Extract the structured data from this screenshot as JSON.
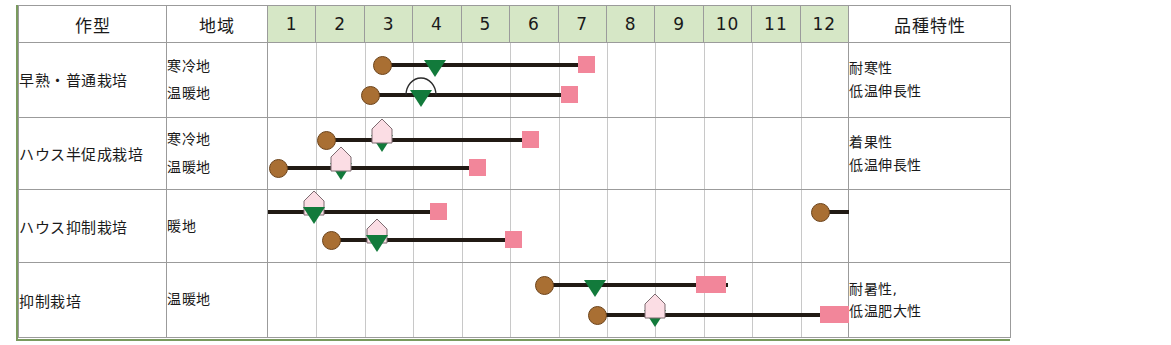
{
  "table": {
    "headers": {
      "crop_type": "作型",
      "region": "地域",
      "traits": "品種特性",
      "months": [
        "1",
        "2",
        "3",
        "4",
        "5",
        "6",
        "7",
        "8",
        "9",
        "10",
        "11",
        "12"
      ]
    },
    "rows": [
      {
        "crop_type": "早熟・普通栽培",
        "regions": [
          "寒冷地",
          "温暖地"
        ],
        "traits": [
          "耐寒性",
          "低温伸長性"
        ]
      },
      {
        "crop_type": "ハウス半促成栽培",
        "regions": [
          "寒冷地",
          "温暖地"
        ],
        "traits": [
          "着果性",
          "低温伸長性"
        ]
      },
      {
        "crop_type": "ハウス抑制栽培",
        "regions": [
          "暖地"
        ],
        "traits": []
      },
      {
        "crop_type": "抑制栽培",
        "regions": [
          "温暖地"
        ],
        "traits": [
          "耐暑性,",
          "低温肥大性"
        ]
      }
    ]
  },
  "chart_data": {
    "type": "table",
    "xlabel": "月",
    "x_axis": {
      "ticks": [
        "1",
        "2",
        "3",
        "4",
        "5",
        "6",
        "7",
        "8",
        "9",
        "10",
        "11",
        "12"
      ],
      "min": 1,
      "max": 13,
      "grid": true
    },
    "legend": [
      {
        "symbol": "brown-circle",
        "meaning": "播種",
        "color": "#a96f33"
      },
      {
        "symbol": "green-triangle",
        "meaning": "定植",
        "color": "#127a3b"
      },
      {
        "symbol": "pink-square",
        "meaning": "収穫",
        "color": "#f2869a"
      },
      {
        "symbol": "house-pentagon",
        "meaning": "ハウス被覆",
        "color": "#fbdde4"
      },
      {
        "symbol": "arc",
        "meaning": "トンネル被覆",
        "color": "#211a14"
      }
    ],
    "series": [
      {
        "name": "早熟・普通栽培 / 寒冷地",
        "row": 0,
        "line": 0,
        "start_month": 3.35,
        "end_month": 7.6,
        "markers": [
          {
            "type": "brown-circle",
            "month": 3.35
          },
          {
            "type": "green-triangle",
            "month": 4.45
          },
          {
            "type": "pink-square",
            "month": 7.45,
            "span": [
              7.4,
              7.75
            ]
          }
        ]
      },
      {
        "name": "早熟・普通栽培 / 温暖地",
        "row": 0,
        "line": 1,
        "start_month": 3.1,
        "end_month": 7.3,
        "markers": [
          {
            "type": "brown-circle",
            "month": 3.1
          },
          {
            "type": "green-triangle",
            "month": 4.15
          },
          {
            "type": "arc",
            "month": 4.15
          },
          {
            "type": "pink-square",
            "month": 7.15,
            "span": [
              7.05,
              7.4
            ]
          }
        ]
      },
      {
        "name": "ハウス半促成栽培 / 寒冷地",
        "row": 1,
        "line": 0,
        "start_month": 2.2,
        "end_month": 6.5,
        "markers": [
          {
            "type": "brown-circle",
            "month": 2.2
          },
          {
            "type": "green-triangle",
            "month": 3.35
          },
          {
            "type": "house-pentagon",
            "month": 3.35
          },
          {
            "type": "pink-square",
            "month": 6.35,
            "span": [
              6.25,
              6.6
            ]
          }
        ]
      },
      {
        "name": "ハウス半促成栽培 / 温暖地",
        "row": 1,
        "line": 1,
        "start_month": 1.2,
        "end_month": 5.4,
        "markers": [
          {
            "type": "brown-circle",
            "month": 1.2
          },
          {
            "type": "green-triangle",
            "month": 2.5
          },
          {
            "type": "house-pentagon",
            "month": 2.5
          },
          {
            "type": "pink-square",
            "month": 5.25,
            "span": [
              5.15,
              5.5
            ]
          }
        ]
      },
      {
        "name": "ハウス抑制栽培 / 暖地 (前期)",
        "row": 2,
        "line": 0,
        "start_month": 1.0,
        "end_month": 4.6,
        "markers": [
          {
            "type": "house-pentagon",
            "month": 1.95
          },
          {
            "type": "green-triangle",
            "month": 1.95
          },
          {
            "type": "pink-square",
            "month": 4.45,
            "span": [
              4.35,
              4.7
            ]
          }
        ]
      },
      {
        "name": "ハウス抑制栽培 / 暖地 (後期)",
        "row": 2,
        "line": 1,
        "start_month": 2.3,
        "end_month": 6.2,
        "markers": [
          {
            "type": "brown-circle",
            "month": 2.3
          },
          {
            "type": "house-pentagon",
            "month": 3.25
          },
          {
            "type": "green-triangle",
            "month": 3.25
          },
          {
            "type": "pink-square",
            "month": 6.0,
            "span": [
              5.9,
              6.25
            ]
          }
        ]
      },
      {
        "name": "ハウス抑制栽培 / 暖地 (12月)",
        "row": 2,
        "line": 0,
        "start_month": 12.4,
        "end_month": 13.0,
        "markers": [
          {
            "type": "brown-circle",
            "month": 12.4
          }
        ]
      },
      {
        "name": "抑制栽培 / 温暖地 (前期)",
        "row": 3,
        "line": 0,
        "start_month": 6.7,
        "end_month": 10.5,
        "markers": [
          {
            "type": "brown-circle",
            "month": 6.7
          },
          {
            "type": "green-triangle",
            "month": 7.75
          },
          {
            "type": "pink-square",
            "month": 10.15,
            "span": [
              9.85,
              10.45
            ]
          }
        ]
      },
      {
        "name": "抑制栽培 / 温暖地 (後期)",
        "row": 3,
        "line": 1,
        "start_month": 7.8,
        "end_month": 13.0,
        "markers": [
          {
            "type": "brown-circle",
            "month": 7.8
          },
          {
            "type": "green-triangle",
            "month": 9.0
          },
          {
            "type": "house-pentagon",
            "month": 9.0
          },
          {
            "type": "pink-square",
            "month": 12.7,
            "span": [
              12.4,
              13.0
            ]
          }
        ]
      }
    ]
  }
}
